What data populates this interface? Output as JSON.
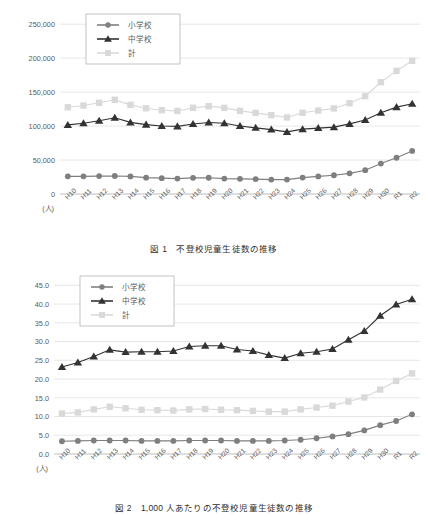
{
  "document": {
    "axis_unit_label": "(人)"
  },
  "figures": [
    {
      "id": "figure-1",
      "caption": "図 1　不登校児童生徒数の推移",
      "caption_number": "図 1",
      "caption_text": "不登校児童生徒数の推移",
      "unit_label": "(人)",
      "legend": [
        {
          "label": "小学校",
          "marker": "circle-marker",
          "color": "#7f7f7f"
        },
        {
          "label": "中学校",
          "marker": "triangle-marker",
          "color": "#333333"
        },
        {
          "label": "計",
          "marker": "square-marker",
          "color": "#d9d9d9"
        }
      ],
      "chart_data": {
        "type": "line",
        "title": "不登校児童生徒数の推移",
        "xlabel": "",
        "ylabel": "(人)",
        "ylim": [
          0,
          265000
        ],
        "yticks": [
          "0",
          "50,000",
          "100,000",
          "150,000",
          "200,000",
          "250,000"
        ],
        "ytick_values": [
          0,
          50000,
          100000,
          150000,
          200000,
          250000
        ],
        "grid": true,
        "legend_position": "top-left",
        "categories": [
          "H10",
          "H11",
          "H12",
          "H13",
          "H14",
          "H15",
          "H16",
          "H17",
          "H18",
          "H19",
          "H20",
          "H21",
          "H22",
          "H23",
          "H24",
          "H25",
          "H26",
          "H27",
          "H28",
          "H29",
          "H30",
          "R1",
          "R2"
        ],
        "series": [
          {
            "name": "小学校",
            "color": "#7f7f7f",
            "marker": "circle",
            "values": [
              26017,
              26047,
              26373,
              26511,
              25869,
              24077,
              23318,
              22709,
              23825,
              23927,
              22652,
              22327,
              22000,
              21243,
              21243,
              24175,
              25864,
              27583,
              30448,
              35032,
              44841,
              53350,
              63350
            ]
          },
          {
            "name": "中学校",
            "color": "#333333",
            "marker": "triangle",
            "values": [
              101675,
              104180,
              107913,
              112211,
              105383,
              102149,
              100040,
              99578,
              103069,
              105328,
              104153,
              100105,
              97428,
              94836,
              91446,
              95442,
              97033,
              98408,
              103235,
              108999,
              119687,
              127922,
              132777
            ]
          },
          {
            "name": "計",
            "color": "#d9d9d9",
            "marker": "square",
            "values": [
              127692,
              130227,
              134286,
              138722,
              131252,
              126226,
              123358,
              122287,
              126894,
              129255,
              126805,
              122432,
              119428,
              116079,
              112689,
              119617,
              122897,
              125991,
              133683,
              144031,
              164528,
              181272,
              196127
            ]
          }
        ]
      }
    },
    {
      "id": "figure-2",
      "caption": "図 2　1,000 人あたりの不登校児童生徒数の推移",
      "caption_number": "図 2",
      "caption_text": "1,000 人あたりの不登校児童生徒数の推移",
      "unit_label": "(人)",
      "legend": [
        {
          "label": "小学校",
          "marker": "circle-marker",
          "color": "#7f7f7f"
        },
        {
          "label": "中学校",
          "marker": "triangle-marker",
          "color": "#333333"
        },
        {
          "label": "計",
          "marker": "square-marker",
          "color": "#d9d9d9"
        }
      ],
      "chart_data": {
        "type": "line",
        "title": "1,000 人あたりの不登校児童生徒数の推移",
        "xlabel": "",
        "ylabel": "(人)",
        "ylim": [
          0,
          47.5
        ],
        "yticks": [
          "0.0",
          "5.0",
          "10.0",
          "15.0",
          "20.0",
          "25.0",
          "30.0",
          "35.0",
          "40.0",
          "45.0"
        ],
        "ytick_values": [
          0,
          5,
          10,
          15,
          20,
          25,
          30,
          35,
          40,
          45
        ],
        "grid": true,
        "legend_position": "top-left",
        "categories": [
          "H10",
          "H11",
          "H12",
          "H13",
          "H14",
          "H15",
          "H16",
          "H17",
          "H18",
          "H19",
          "H20",
          "H21",
          "H22",
          "H23",
          "H24",
          "H25",
          "H26",
          "H27",
          "H28",
          "H29",
          "H30",
          "R1",
          "R2"
        ],
        "series": [
          {
            "name": "小学校",
            "color": "#7f7f7f",
            "marker": "circle",
            "values": [
              3.4,
              3.5,
              3.6,
              3.6,
              3.6,
              3.5,
              3.5,
              3.5,
              3.6,
              3.6,
              3.6,
              3.5,
              3.5,
              3.5,
              3.6,
              3.8,
              4.2,
              4.7,
              5.3,
              6.3,
              7.7,
              8.8,
              10.6
            ]
          },
          {
            "name": "中学校",
            "color": "#333333",
            "marker": "triangle",
            "values": [
              23.2,
              24.4,
              26.0,
              27.8,
              27.2,
              27.3,
              27.3,
              27.5,
              28.7,
              28.9,
              28.9,
              27.9,
              27.5,
              26.4,
              25.6,
              26.9,
              27.3,
              28.0,
              30.5,
              32.8,
              36.9,
              39.9,
              41.3
            ]
          },
          {
            "name": "計",
            "color": "#d9d9d9",
            "marker": "square",
            "values": [
              10.8,
              11.1,
              11.9,
              12.6,
              12.2,
              11.8,
              11.7,
              11.6,
              11.9,
              12.0,
              11.8,
              11.7,
              11.5,
              11.3,
              11.3,
              11.9,
              12.4,
              12.9,
              14.0,
              15.1,
              17.2,
              19.5,
              21.5
            ]
          }
        ]
      }
    }
  ]
}
